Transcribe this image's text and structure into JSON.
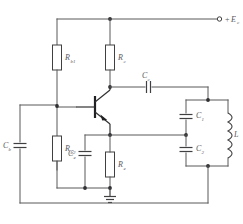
{
  "figure": {
    "background_color": "#ffffff",
    "wire_color": "#58585a",
    "label_color": "#58585a"
  },
  "supply": {
    "label_sign": "+",
    "label_symbol": "E",
    "label_subscript": "c",
    "terminal_name": "supply-terminal"
  },
  "components": {
    "rb1": {
      "symbol": "R",
      "subscript": "b1",
      "type": "resistor"
    },
    "rc": {
      "symbol": "R",
      "subscript": "c",
      "type": "resistor"
    },
    "rb2": {
      "symbol": "R",
      "subscript": "b2",
      "type": "resistor"
    },
    "re": {
      "symbol": "R",
      "subscript": "e",
      "type": "resistor"
    },
    "cb": {
      "symbol": "C",
      "subscript": "b",
      "type": "capacitor"
    },
    "ce": {
      "symbol": "C",
      "subscript": "e",
      "type": "capacitor"
    },
    "cc": {
      "symbol": "C",
      "subscript": "c",
      "type": "capacitor"
    },
    "c1": {
      "symbol": "C",
      "subscript": "1",
      "type": "capacitor"
    },
    "c2": {
      "symbol": "C",
      "subscript": "2",
      "type": "capacitor"
    },
    "l": {
      "symbol": "L",
      "subscript": "",
      "type": "inductor"
    },
    "transistor": {
      "symbol": "",
      "subscript": "",
      "type": "npn-transistor"
    },
    "ground": {
      "symbol": "",
      "subscript": "",
      "type": "ground"
    }
  }
}
